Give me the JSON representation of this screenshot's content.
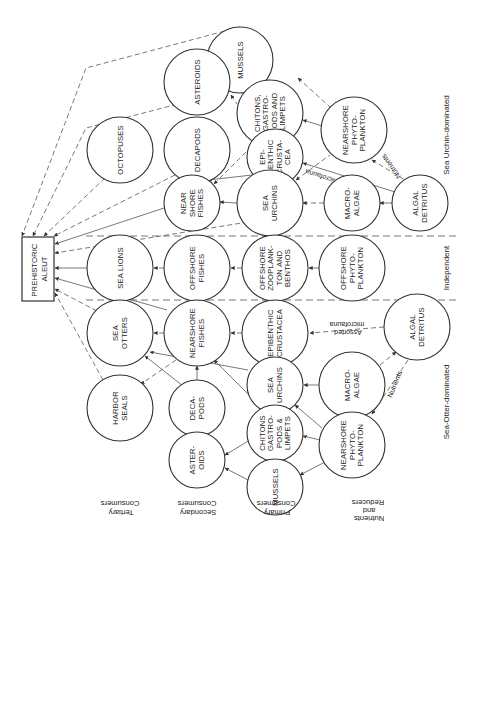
{
  "diagram": {
    "apex": {
      "id": "aleut",
      "lines": [
        "PREHISTORIC",
        "ALEUT"
      ]
    },
    "sections": [
      {
        "id": "urchin",
        "label": "Sea Urchin-dominated"
      },
      {
        "id": "independent",
        "label": "Independent"
      },
      {
        "id": "otter",
        "label": "Sea-Otter-dominated"
      }
    ],
    "trophic_levels": [
      {
        "id": "tertiary",
        "lines": [
          "Tertiary",
          "Consumers"
        ]
      },
      {
        "id": "secondary",
        "lines": [
          "Secondary",
          "Consumers"
        ]
      },
      {
        "id": "primary",
        "lines": [
          "Primary",
          "Consumers"
        ]
      },
      {
        "id": "nutrients",
        "lines": [
          "Nutrients",
          "and",
          "Reducers"
        ]
      }
    ],
    "nodes": {
      "u_mussels": {
        "lines": [
          "MUSSELS"
        ]
      },
      "u_asteroids": {
        "lines": [
          "ASTEROIDS"
        ]
      },
      "u_chitons": {
        "lines": [
          "CHITONS,",
          "GASTRO-",
          "PODS AND",
          "LIMPETS"
        ]
      },
      "u_phyto": {
        "lines": [
          "NEARSHORE",
          "PHYTO-",
          "PLANKTON"
        ]
      },
      "u_octopuses": {
        "lines": [
          "OCTOPUSES"
        ]
      },
      "u_decapods": {
        "lines": [
          "DECAPODS"
        ]
      },
      "u_epibenthic": {
        "lines": [
          "EPI-",
          "BENTHIC",
          "CRUSTA-",
          "CEA"
        ]
      },
      "u_fishes": {
        "lines": [
          "NEAR",
          "SHORE",
          "FISHES"
        ]
      },
      "u_urchins": {
        "lines": [
          "SEA",
          "URCHINS"
        ]
      },
      "u_macroalgae": {
        "lines": [
          "MACRO-",
          "ALGAE"
        ]
      },
      "u_detritus": {
        "lines": [
          "ALGAL",
          "DETRITUS"
        ]
      },
      "i_sealions": {
        "lines": [
          "SEA LIONS"
        ]
      },
      "i_fishes": {
        "lines": [
          "OFFSHORE",
          "FISHES"
        ]
      },
      "i_zoo": {
        "lines": [
          "OFFSHORE",
          "ZOOPLANK-",
          "TON AND",
          "BENTHOS"
        ]
      },
      "i_phyto": {
        "lines": [
          "OFFSHORE",
          "PHYTO-",
          "PLANKTON"
        ]
      },
      "o_otters": {
        "lines": [
          "SEA",
          "OTTERS"
        ]
      },
      "o_fishes": {
        "lines": [
          "NEARSHORE",
          "FISHES"
        ]
      },
      "o_epibenthic": {
        "lines": [
          "EPIBENTHIC",
          "CRUSTACEA"
        ]
      },
      "o_detritus": {
        "lines": [
          "ALGAL",
          "DETRITUS"
        ]
      },
      "o_urchins": {
        "lines": [
          "SEA",
          "URCHINS"
        ]
      },
      "o_macroalgae": {
        "lines": [
          "MACRO-",
          "ALGAE"
        ]
      },
      "o_seals": {
        "lines": [
          "HARBOR",
          "SEALS"
        ]
      },
      "o_decapods": {
        "lines": [
          "DECA-",
          "PODS"
        ]
      },
      "o_chitons": {
        "lines": [
          "CHITONS",
          "GASTRO-",
          "PODS &",
          "LIMPETS"
        ]
      },
      "o_phyto": {
        "lines": [
          "NEARSHORE",
          "PHYTO-",
          "PLANKTON"
        ]
      },
      "o_asteroids": {
        "lines": [
          "ASTER-",
          "OIDS"
        ]
      },
      "o_mussels": {
        "lines": [
          "MUSSELS"
        ]
      }
    },
    "edge_labels": {
      "u_microfauna": "Associated microfauna",
      "u_nutrients": "Nutrients",
      "o_microfauna": [
        "Assorted",
        "microfauna"
      ],
      "o_nutrients": "Nutrients"
    }
  }
}
